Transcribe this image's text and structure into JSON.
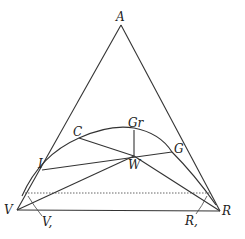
{
  "diagram": {
    "labels": {
      "A": "A",
      "V": "V",
      "R": "R",
      "C": "C",
      "Gr": "Gr",
      "G": "G",
      "W": "W",
      "I": "I",
      "V_sub": "V,",
      "R_sub": "R,"
    },
    "colors": {
      "line": "#333333",
      "background": "#ffffff"
    }
  }
}
